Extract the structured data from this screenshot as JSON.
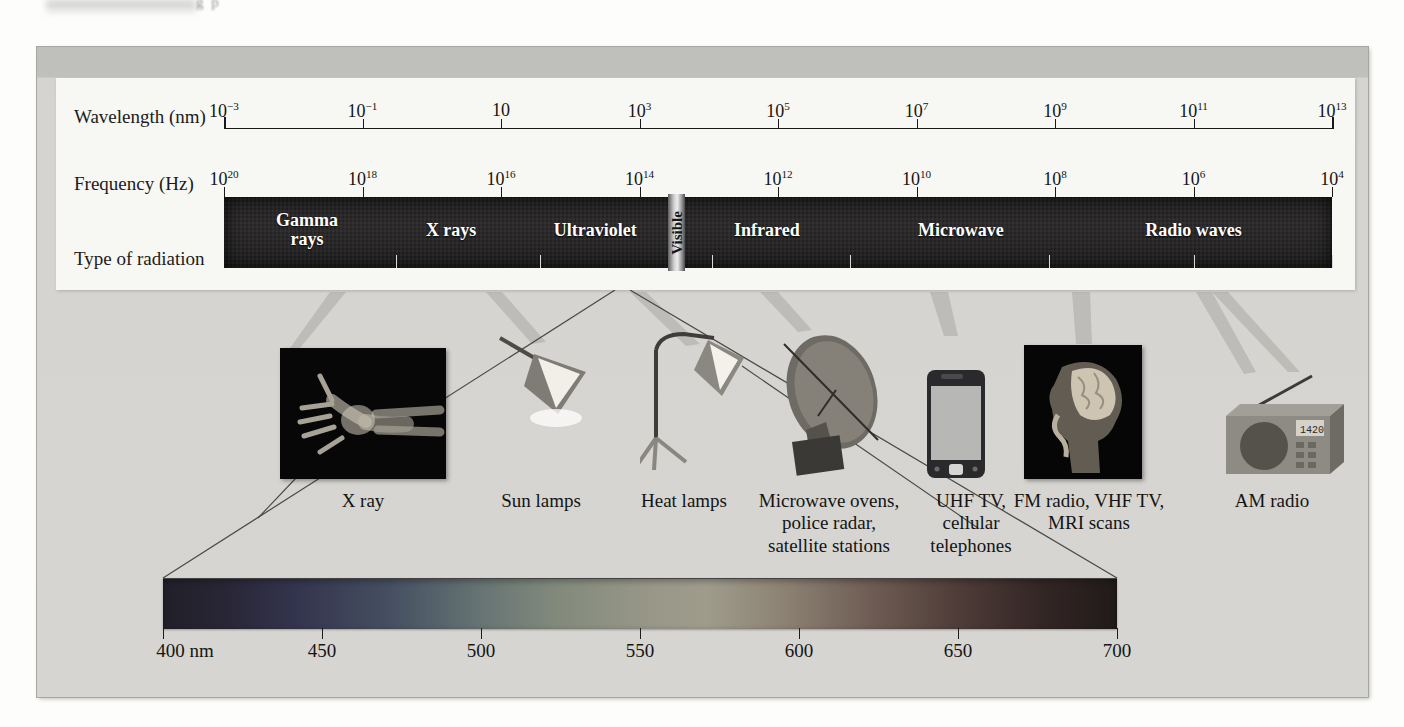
{
  "figure": {
    "page_partial_text": "  g    p ",
    "row_labels": {
      "wavelength": "Wavelength (nm)",
      "frequency": "Frequency (Hz)",
      "type": "Type of radiation"
    }
  },
  "chart_data": {
    "type": "bar",
    "xlabel": "Wavelength (nm)  /  Frequency (Hz)",
    "ylabel": "",
    "grid": false,
    "legend": "none",
    "wavelength_axis": {
      "label": "Wavelength (nm)",
      "unit": "nm",
      "scale": "log",
      "ticks": [
        {
          "pos": 0.0,
          "label": "10",
          "exp": "−3"
        },
        {
          "pos": 0.125,
          "label": "10",
          "exp": "−1"
        },
        {
          "pos": 0.25,
          "label": "10",
          "exp": ""
        },
        {
          "pos": 0.375,
          "label": "10",
          "exp": "3"
        },
        {
          "pos": 0.5,
          "label": "10",
          "exp": "5"
        },
        {
          "pos": 0.625,
          "label": "10",
          "exp": "7"
        },
        {
          "pos": 0.75,
          "label": "10",
          "exp": "9"
        },
        {
          "pos": 0.875,
          "label": "10",
          "exp": "11"
        },
        {
          "pos": 1.0,
          "label": "10",
          "exp": "13"
        }
      ]
    },
    "frequency_axis": {
      "label": "Frequency (Hz)",
      "unit": "Hz",
      "scale": "log",
      "ticks": [
        {
          "pos": 0.0,
          "label": "10",
          "exp": "20"
        },
        {
          "pos": 0.125,
          "label": "10",
          "exp": "18"
        },
        {
          "pos": 0.25,
          "label": "10",
          "exp": "16"
        },
        {
          "pos": 0.375,
          "label": "10",
          "exp": "14"
        },
        {
          "pos": 0.5,
          "label": "10",
          "exp": "12"
        },
        {
          "pos": 0.625,
          "label": "10",
          "exp": "10"
        },
        {
          "pos": 0.75,
          "label": "10",
          "exp": "8"
        },
        {
          "pos": 0.875,
          "label": "10",
          "exp": "6"
        },
        {
          "pos": 1.0,
          "label": "10",
          "exp": "4"
        }
      ]
    },
    "bands": [
      {
        "name": "Gamma rays",
        "label": "Gamma\nrays",
        "center": 0.075
      },
      {
        "name": "X rays",
        "label": "X rays",
        "center": 0.205
      },
      {
        "name": "Ultraviolet",
        "label": "Ultraviolet",
        "center": 0.335
      },
      {
        "name": "Visible",
        "label": "Visible",
        "center": 0.405
      },
      {
        "name": "Infrared",
        "label": "Infrared",
        "center": 0.49
      },
      {
        "name": "Microwave",
        "label": "Microwave",
        "center": 0.665
      },
      {
        "name": "Radio waves",
        "label": "Radio waves",
        "center": 0.875
      }
    ],
    "band_ticks": [
      0.155,
      0.285,
      0.44,
      0.565,
      0.745,
      0.875,
      1.0
    ],
    "visible_spectrum": {
      "label": "Visible light spectrum",
      "unit": "nm",
      "range_nm": [
        400,
        700
      ],
      "ticks": [
        {
          "value": 400,
          "label": "400 nm"
        },
        {
          "value": 450,
          "label": "450"
        },
        {
          "value": 500,
          "label": "500"
        },
        {
          "value": 550,
          "label": "550"
        },
        {
          "value": 600,
          "label": "600"
        },
        {
          "value": 650,
          "label": "650"
        },
        {
          "value": 700,
          "label": "700"
        }
      ]
    },
    "applications": [
      {
        "id": "xray",
        "caption": "X ray",
        "icon": "xray-hand-image",
        "x": 363,
        "band": "X rays"
      },
      {
        "id": "sunlamps",
        "caption": "Sun lamps",
        "icon": "sun-lamp-image",
        "x": 541,
        "band": "Ultraviolet"
      },
      {
        "id": "heatlamps",
        "caption": "Heat lamps",
        "icon": "heat-lamp-image",
        "x": 684,
        "band": "Infrared"
      },
      {
        "id": "microwave",
        "caption": "Microwave ovens,\npolice radar,\nsatellite stations",
        "icon": "satellite-dish-image",
        "x": 829,
        "band": "Microwave"
      },
      {
        "id": "uhf",
        "caption": "UHF TV,\ncellular\ntelephones",
        "icon": "cell-phone-image",
        "x": 971,
        "band": "Microwave"
      },
      {
        "id": "fm",
        "caption": "FM radio, VHF TV,\nMRI scans",
        "icon": "mri-scan-image",
        "x": 1089,
        "band": "Radio waves"
      },
      {
        "id": "am",
        "caption": "AM radio",
        "icon": "am-radio-image",
        "x": 1272,
        "band": "Radio waves"
      }
    ]
  },
  "colors": {
    "band_black": "#1f1d1e",
    "frame_gray": "#d3d2ce",
    "panel_white": "#f7f7f4",
    "page_bg": "#fdfdfb",
    "ink": "#151515"
  }
}
